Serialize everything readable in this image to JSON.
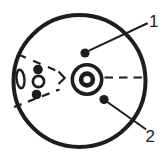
{
  "diagram": {
    "labels": {
      "callout_1": "1",
      "callout_2": "2"
    }
  },
  "colors": {
    "ink": "#1d1d1d",
    "background": "#ffffff"
  }
}
